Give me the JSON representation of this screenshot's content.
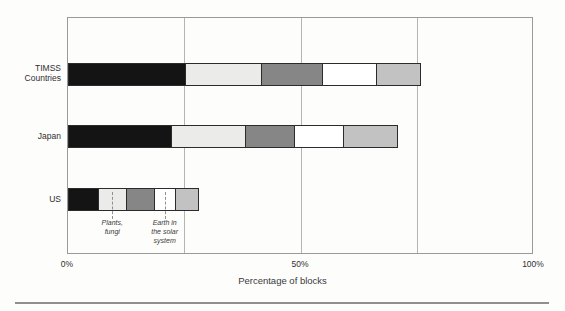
{
  "figure": {
    "background": "#fdfdfc",
    "plot_border_color": "#9a9a9a",
    "gridline_color": "#b4b4b2",
    "segment_border_color": "#2b2b2b",
    "gridlines_pct": [
      25,
      50,
      75
    ],
    "x_ticks": [
      {
        "label": "0%",
        "pct": 0
      },
      {
        "label": "50%",
        "pct": 50
      },
      {
        "label": "100%",
        "pct": 100
      }
    ]
  },
  "chart_data": {
    "type": "bar",
    "orientation": "horizontal",
    "stacked": true,
    "unit": "percent",
    "title": "",
    "xlabel": "Percentage of blocks",
    "ylabel": "",
    "xlim": [
      0,
      100
    ],
    "categories": [
      "TIMSS Countries",
      "Japan",
      "US"
    ],
    "series_colors": {
      "rank1": "#141414",
      "rank2": "#ebebe9",
      "rank3": "#868686",
      "rank4": "#ffffff",
      "rank5": "#c2c2c2"
    },
    "rows": [
      {
        "category": "TIMSS\nCountries",
        "segments": [
          {
            "label": "Most emphasized topic",
            "value": 25,
            "color": "#141414",
            "label_pos": "above",
            "leader": false
          },
          {
            "label": "Second most\nemphasized topic",
            "value": 16.5,
            "color": "#ebebe9",
            "label_pos": "above",
            "leader": false
          },
          {
            "label": "Third most\nemphasized topic",
            "value": 13,
            "color": "#868686",
            "label_pos": "above",
            "leader": false
          },
          {
            "label": "Fourth most\nemphasized\ntopic",
            "value": 11.5,
            "color": "#ffffff",
            "label_pos": "above",
            "leader": false
          },
          {
            "label": "Fifth most\nemphasized\ntopic",
            "value": 9.5,
            "color": "#c2c2c2",
            "label_pos": "above",
            "leader": false
          }
        ]
      },
      {
        "category": "Japan",
        "segments": [
          {
            "label": "Plants, fungi",
            "value": 22,
            "color": "#141414",
            "label_pos": "above",
            "leader": false
          },
          {
            "label": "Physical\nproperties of\nmatter",
            "value": 16,
            "color": "#ebebe9",
            "label_pos": "above",
            "leader": false
          },
          {
            "label": "Animals",
            "value": 10.5,
            "color": "#868686",
            "label_pos": "above",
            "leader": false
          },
          {
            "label": "Bodies of\nwater",
            "value": 10.5,
            "color": "#ffffff",
            "label_pos": "above",
            "leader": false
          },
          {
            "label": "Earth's\nphysical cycles",
            "value": 11.5,
            "color": "#c2c2c2",
            "label_pos": "above",
            "leader": false
          }
        ]
      },
      {
        "category": "US",
        "segments": [
          {
            "label": "Animals",
            "value": 6.5,
            "color": "#141414",
            "label_pos": "above",
            "leader": false
          },
          {
            "label": "Plants,\nfungi",
            "value": 6,
            "color": "#ebebe9",
            "label_pos": "below",
            "leader": true
          },
          {
            "label": "Organs,\nTissues",
            "value": 6,
            "color": "#868686",
            "label_pos": "above",
            "leader": false
          },
          {
            "label": "Earth in\nthe solar\nsystem",
            "value": 4.5,
            "color": "#ffffff",
            "label_pos": "below",
            "leader": true
          },
          {
            "label": "Applications of science\nin math &\ntechnology",
            "value": 5,
            "color": "#c2c2c2",
            "label_pos": "above",
            "leader": false
          }
        ]
      }
    ]
  }
}
